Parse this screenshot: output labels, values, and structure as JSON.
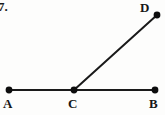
{
  "figure": {
    "problem_number": "7.",
    "canvas": {
      "width": 165,
      "height": 115
    },
    "background_color": "#fdfdfc",
    "stroke_color": "#1a1a1a",
    "point_color": "#0d0d0d",
    "line_width": 2,
    "point_radius": 3.4,
    "points": [
      {
        "id": "A",
        "label": "A",
        "x": 9,
        "y": 90,
        "label_x": 3,
        "label_y": 97
      },
      {
        "id": "C",
        "label": "C",
        "x": 74,
        "y": 90,
        "label_x": 68,
        "label_y": 97
      },
      {
        "id": "B",
        "label": "B",
        "x": 155,
        "y": 90,
        "label_x": 149,
        "label_y": 97
      },
      {
        "id": "D",
        "label": "D",
        "x": 157,
        "y": 15,
        "label_x": 140,
        "label_y": 1
      }
    ],
    "segments": [
      {
        "id": "AB",
        "from": "A",
        "to": "B",
        "x1": 9,
        "y1": 90,
        "x2": 155,
        "y2": 90
      },
      {
        "id": "CD",
        "from": "C",
        "to": "D",
        "x1": 74,
        "y1": 90,
        "x2": 157,
        "y2": 15
      }
    ]
  }
}
